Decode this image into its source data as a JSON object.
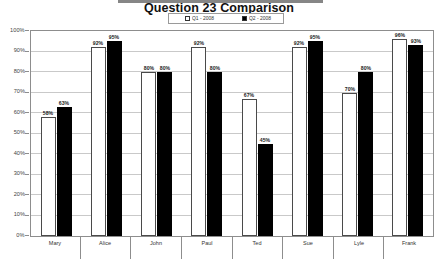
{
  "chart_data": {
    "type": "bar",
    "title": "Question 23 Comparison",
    "xlabel": "",
    "ylabel": "",
    "ylim": [
      0,
      100
    ],
    "ytick_labels": [
      "100%",
      "90%",
      "80%",
      "70%",
      "60%",
      "50%",
      "40%",
      "30%",
      "20%",
      "10%",
      "0%"
    ],
    "grid": true,
    "legend_position": "top-center",
    "categories": [
      "Mary",
      "Alice",
      "John",
      "Paul",
      "Ted",
      "Sue",
      "Lyle",
      "Frank"
    ],
    "series": [
      {
        "name": "Q1 - 2008",
        "color": "#ffffff",
        "values": [
          58,
          92,
          80,
          92,
          67,
          92,
          70,
          96
        ],
        "labels": [
          "58%",
          "92%",
          "80%",
          "92%",
          "67%",
          "92%",
          "70%",
          "96%"
        ]
      },
      {
        "name": "Q2 - 2008",
        "color": "#000000",
        "values": [
          63,
          95,
          80,
          80,
          45,
          95,
          80,
          93
        ],
        "labels": [
          "63%",
          "95%",
          "80%",
          "80%",
          "45%",
          "95%",
          "80%",
          "93%"
        ]
      }
    ]
  }
}
